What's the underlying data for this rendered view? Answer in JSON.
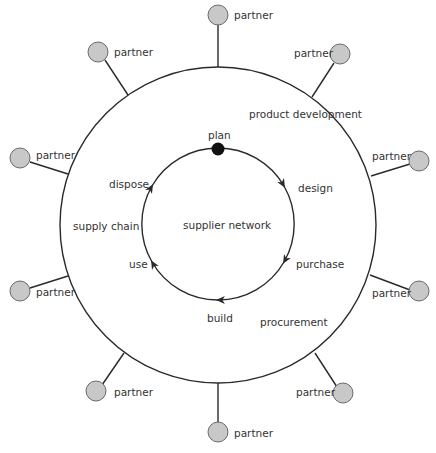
{
  "diagram": {
    "outer_ring": {
      "cx": 218,
      "cy": 225,
      "r": 158,
      "labels": {
        "product_development": "product development",
        "supply_chain": "supply chain",
        "procurement": "procurement"
      }
    },
    "inner_ring": {
      "cx": 218,
      "cy": 224,
      "r": 76,
      "center_label": "supplier network"
    },
    "cycle_steps": [
      {
        "label": "plan"
      },
      {
        "label": "design"
      },
      {
        "label": "purchase"
      },
      {
        "label": "build"
      },
      {
        "label": "use"
      },
      {
        "label": "dispose"
      }
    ],
    "partners": [
      {
        "label": "partner"
      },
      {
        "label": "partner"
      },
      {
        "label": "partner"
      },
      {
        "label": "partner"
      },
      {
        "label": "partner"
      },
      {
        "label": "partner"
      },
      {
        "label": "partner"
      },
      {
        "label": "partner"
      },
      {
        "label": "partner"
      },
      {
        "label": "partner"
      }
    ],
    "colors": {
      "line": "#2a2a2a",
      "partner_fill": "#c8c8c8",
      "partner_stroke": "#6a6a6a",
      "start_dot": "#111111",
      "text": "#333333"
    }
  }
}
